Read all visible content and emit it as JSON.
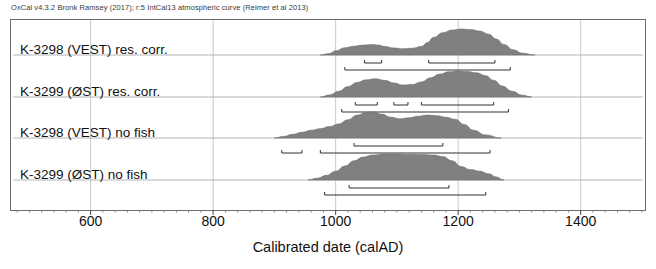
{
  "header": {
    "credit": "OxCal v4.3.2 Bronk Ramsey (2017); r:5 IntCal13 atmospheric curve (Reimer et al 2013)"
  },
  "axis": {
    "title": "Calibrated date (calAD)",
    "ticks": [
      "600",
      "800",
      "1000",
      "1200",
      "1400"
    ],
    "tick_values": [
      600,
      800,
      1000,
      1200,
      1400
    ],
    "range": [
      470,
      1505
    ],
    "minor_tick_step": 20
  },
  "style": {
    "fill_color": "#808080",
    "outline_color": "#6e6e6e",
    "grid_color": "#c8c8c8",
    "baseline_color": "#b4b4b4",
    "range_bar_color": "#303030",
    "background": "#ffffff"
  },
  "rows": [
    {
      "label": "K-3298 (VEST) res. corr.",
      "baseline_y": 55,
      "curve_start": 975,
      "curve_end": 1325
    },
    {
      "label": "K-3299 (ØST) res. corr.",
      "baseline_y": 97,
      "curve_start": 975,
      "curve_end": 1320
    },
    {
      "label": "K-3298 (VEST) no fish",
      "baseline_y": 138,
      "curve_start": 900,
      "curve_end": 1270
    },
    {
      "label": "K-3299 (ØST) no fish",
      "baseline_y": 180,
      "curve_start": 955,
      "curve_end": 1275
    }
  ],
  "chart_data": {
    "type": "area",
    "xlabel": "Calibrated date (calAD)",
    "ylabel": "",
    "xlim": [
      470,
      1505
    ],
    "grid": true,
    "legend": "none",
    "series": [
      {
        "name": "K-3298 (VEST) res. corr.",
        "x": [
          975,
          990,
          1000,
          1015,
          1030,
          1045,
          1060,
          1070,
          1080,
          1095,
          1110,
          1125,
          1140,
          1150,
          1160,
          1175,
          1190,
          1205,
          1220,
          1235,
          1250,
          1262,
          1275,
          1290,
          1305,
          1325
        ],
        "probability": [
          0.0,
          0.06,
          0.16,
          0.28,
          0.34,
          0.38,
          0.4,
          0.38,
          0.33,
          0.27,
          0.24,
          0.26,
          0.33,
          0.48,
          0.68,
          0.86,
          0.96,
          1.0,
          0.98,
          0.92,
          0.8,
          0.62,
          0.4,
          0.2,
          0.07,
          0.0
        ],
        "ranges_68": [
          [
            1047,
            1075
          ],
          [
            1152,
            1260
          ]
        ],
        "ranges_95": [
          [
            1015,
            1285
          ]
        ]
      },
      {
        "name": "K-3299 (ØST) res. corr.",
        "x": [
          975,
          990,
          1005,
          1020,
          1035,
          1050,
          1065,
          1080,
          1095,
          1110,
          1125,
          1140,
          1155,
          1170,
          1185,
          1200,
          1215,
          1230,
          1245,
          1258,
          1272,
          1288,
          1305,
          1320
        ],
        "probability": [
          0.0,
          0.08,
          0.22,
          0.4,
          0.56,
          0.66,
          0.7,
          0.64,
          0.54,
          0.46,
          0.48,
          0.58,
          0.74,
          0.88,
          0.97,
          1.0,
          0.98,
          0.93,
          0.82,
          0.64,
          0.42,
          0.22,
          0.07,
          0.0
        ],
        "ranges_68": [
          [
            1032,
            1068
          ],
          [
            1095,
            1118
          ],
          [
            1140,
            1258
          ]
        ],
        "ranges_95": [
          [
            1010,
            1282
          ]
        ]
      },
      {
        "name": "K-3298 (VEST) no fish",
        "x": [
          900,
          915,
          930,
          945,
          960,
          975,
          990,
          1005,
          1020,
          1035,
          1050,
          1062,
          1075,
          1090,
          1105,
          1120,
          1135,
          1150,
          1165,
          1180,
          1195,
          1210,
          1225,
          1245,
          1270
        ],
        "probability": [
          0.0,
          0.06,
          0.14,
          0.22,
          0.3,
          0.36,
          0.44,
          0.54,
          0.7,
          0.88,
          0.98,
          1.0,
          0.92,
          0.8,
          0.74,
          0.78,
          0.84,
          0.88,
          0.86,
          0.8,
          0.72,
          0.52,
          0.3,
          0.12,
          0.0
        ],
        "ranges_68": [
          [
            1030,
            1175
          ]
        ],
        "ranges_95": [
          [
            912,
            945
          ],
          [
            975,
            1252
          ]
        ]
      },
      {
        "name": "K-3299 (ØST) no fish",
        "x": [
          955,
          970,
          985,
          1000,
          1015,
          1030,
          1045,
          1060,
          1080,
          1100,
          1120,
          1140,
          1160,
          1175,
          1190,
          1205,
          1220,
          1235,
          1250,
          1262,
          1275
        ],
        "probability": [
          0.0,
          0.07,
          0.18,
          0.34,
          0.54,
          0.74,
          0.88,
          0.96,
          1.0,
          1.0,
          0.99,
          0.98,
          0.96,
          0.9,
          0.74,
          0.52,
          0.4,
          0.34,
          0.24,
          0.12,
          0.0
        ],
        "ranges_68": [
          [
            1022,
            1185
          ]
        ],
        "ranges_95": [
          [
            982,
            1245
          ]
        ]
      }
    ]
  }
}
